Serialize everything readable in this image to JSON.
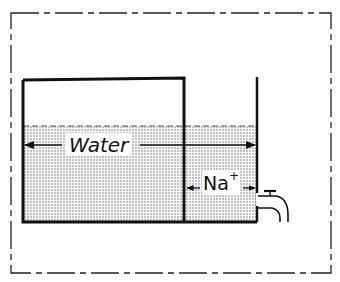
{
  "diagram": {
    "type": "body-fluid-compartment-schematic",
    "labels": {
      "water": "Water",
      "sodium_base": "Na",
      "sodium_charge": "+"
    },
    "elements": {
      "outer_boundary": "dash-dot rectangle enclosing the body",
      "left_compartment": "tall open-top container (intracellular)",
      "right_compartment": "narrow compartment with tap (extracellular)",
      "fluid_level": "dashed line at top of shaded fluid",
      "tap": "outflow tap on right wall"
    },
    "arrows": {
      "water_arrow": "double-headed arrow spanning both compartments",
      "sodium_arrow": "double-headed arrow spanning right compartment only"
    },
    "colors": {
      "ink": "#111111",
      "fluid_dots": "#555555",
      "background": "#ffffff"
    }
  }
}
